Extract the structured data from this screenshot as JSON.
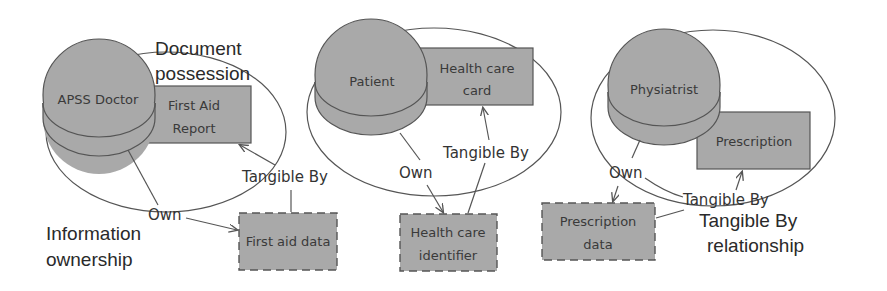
{
  "colors": {
    "background": "#ffffff",
    "shape_fill": "#a9a9a9",
    "stroke": "#555555",
    "text": "#333333"
  },
  "groups": [
    {
      "actor": "APSS Doctor",
      "document": "First Aid Report",
      "document_lines": [
        "First Aid",
        "Report"
      ],
      "information": "First aid data",
      "information_lines": [
        "First aid data"
      ],
      "own_label": "Own",
      "tangible_label": "Tangible By"
    },
    {
      "actor": "Patient",
      "document": "Health care card",
      "document_lines": [
        "Health care",
        "card"
      ],
      "information": "Health care identifier",
      "information_lines": [
        "Health care",
        "identifier"
      ],
      "own_label": "Own",
      "tangible_label": "Tangible By"
    },
    {
      "actor": "Physiatrist",
      "document": "Prescription",
      "document_lines": [
        "Prescription"
      ],
      "information": "Prescription data",
      "information_lines": [
        "Prescription",
        "data"
      ],
      "own_label": "Own",
      "tangible_label": "Tangible By"
    }
  ],
  "annotations": {
    "document_possession": [
      "Document",
      "possession"
    ],
    "information_ownership": [
      "Information",
      "ownership"
    ],
    "tangible_by_relationship": [
      "Tangible By",
      "relationship"
    ]
  }
}
